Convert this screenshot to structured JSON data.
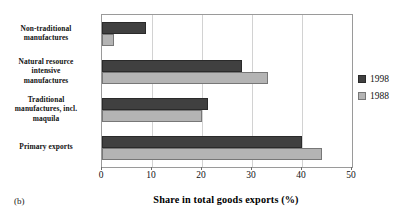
{
  "panel": {
    "caption": "(b)"
  },
  "chart_data": {
    "type": "bar",
    "orientation": "horizontal",
    "title": "",
    "xlabel": "Share in total goods exports (%)",
    "ylabel": "",
    "xlim": [
      0,
      50
    ],
    "xticks": [
      0,
      10,
      20,
      30,
      40,
      50
    ],
    "xtick_labels": [
      "0",
      "10",
      "20",
      "30",
      "40",
      "50"
    ],
    "grid": "vertical",
    "legend_position": "right",
    "categories": [
      "Non-traditional manufactures",
      "Natural resource intensive manufactures",
      "Traditional manufactures, incl. maquila",
      "Primary exports"
    ],
    "category_lines": [
      [
        "Non-traditional",
        "manufactures"
      ],
      [
        "Natural resource",
        "intensive",
        "manufactures"
      ],
      [
        "Traditional",
        "manufactures, incl.",
        "maquila"
      ],
      [
        "Primary exports"
      ]
    ],
    "series": [
      {
        "name": "1998",
        "color": "#404040",
        "values": [
          8.8,
          28.0,
          21.2,
          40.0
        ]
      },
      {
        "name": "1988",
        "color": "#b4b4b4",
        "values": [
          2.4,
          33.2,
          20.0,
          44.0
        ]
      }
    ]
  }
}
